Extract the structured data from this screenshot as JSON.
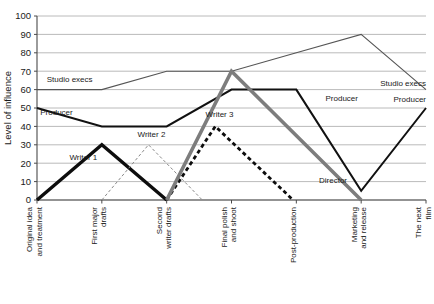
{
  "chart_data": {
    "type": "line",
    "title": "",
    "xlabel": "",
    "ylabel": "Level of influence",
    "ylim": [
      0,
      100
    ],
    "ytick_step": 10,
    "grid": true,
    "legend_position": "inline-labels",
    "yticks": [
      "0",
      "10",
      "20",
      "30",
      "40",
      "50",
      "60",
      "70",
      "80",
      "90",
      "100"
    ],
    "categories": [
      "Original idea and treatment",
      "First major drafts",
      "Second writer drafts",
      "Final polish and shoot",
      "Post-production",
      "Marketing and release",
      "The next film"
    ],
    "series": [
      {
        "name": "Studio execs",
        "style": "solid-thin",
        "color": "#555555",
        "width": 1.1,
        "values": [
          60,
          60,
          70,
          70,
          80,
          90,
          60
        ],
        "labels": [
          {
            "text": "Studio execs",
            "x_index": 0.15,
            "value": 64,
            "align": "start"
          },
          {
            "text": "Studio execs",
            "x_index": 6.0,
            "value": 62,
            "align": "end"
          }
        ]
      },
      {
        "name": "Producer",
        "style": "solid-medium",
        "color": "#111111",
        "width": 2.0,
        "values": [
          50,
          40,
          40,
          60,
          60,
          5,
          50
        ],
        "labels": [
          {
            "text": "Producer",
            "x_index": 0.05,
            "value": 46,
            "align": "start"
          },
          {
            "text": "Producer",
            "x_index": 4.45,
            "value": 54,
            "align": "start"
          },
          {
            "text": "Producer",
            "x_index": 6.0,
            "value": 53,
            "align": "end"
          }
        ]
      },
      {
        "name": "Writer 1",
        "style": "solid-thick",
        "color": "#0d0d0d",
        "width": 3.4,
        "values": [
          0,
          30,
          0,
          null,
          null,
          null,
          null
        ],
        "labels": [
          {
            "text": "Writer 1",
            "x_index": 0.5,
            "value": 22,
            "align": "start"
          }
        ]
      },
      {
        "name": "Writer 2",
        "style": "dashed-thin",
        "color": "#8a8a8a",
        "width": 1.0,
        "dash": "3,2.2",
        "values": [
          null,
          0,
          30,
          0,
          null,
          null,
          null
        ],
        "half_steps": true,
        "labels": [
          {
            "text": "Writer 2",
            "x_index": 1.55,
            "value": 34,
            "align": "start"
          }
        ]
      },
      {
        "name": "Writer 3",
        "style": "dashed-thick",
        "color": "#0d0d0d",
        "width": 2.8,
        "dash": "4,3",
        "values": [
          null,
          null,
          0,
          40,
          0,
          null,
          null
        ],
        "half_steps": true,
        "labels": [
          {
            "text": "Writer 3",
            "x_index": 2.6,
            "value": 45,
            "align": "start"
          }
        ]
      },
      {
        "name": "Director",
        "style": "solid-thick-gray",
        "color": "#7d7d7d",
        "width": 3.6,
        "values": [
          null,
          null,
          0,
          70,
          null,
          0,
          null
        ],
        "labels": [
          {
            "text": "Director",
            "x_index": 4.35,
            "value": 9,
            "align": "start"
          }
        ]
      }
    ]
  },
  "colors": {
    "background": "#ffffff",
    "gridline": "#a8a8a8",
    "axis": "#4a4a4a",
    "text": "#1a1a1a",
    "studio_execs": "#555555",
    "producer": "#111111",
    "writer1": "#0d0d0d",
    "writer2": "#8a8a8a",
    "writer3": "#0d0d0d",
    "director": "#7d7d7d"
  }
}
